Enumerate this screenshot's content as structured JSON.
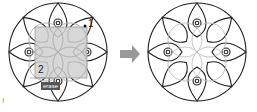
{
  "diagram": {
    "left_panel": {
      "description": "Rosette with selection window",
      "pick_point_1_label": "1",
      "pick_point_2_label": "2",
      "tooltip_label": "erase",
      "corner_mark": "!"
    },
    "right_panel": {
      "description": "Rosette with inner circles erased/greyed"
    },
    "arrow": "right-arrow",
    "colors": {
      "line": "#222222",
      "ghost": "#bbbbbb",
      "selection_fill": "#d0d0d0",
      "arrow": "#999999",
      "tooltip_bg": "#555555"
    }
  }
}
